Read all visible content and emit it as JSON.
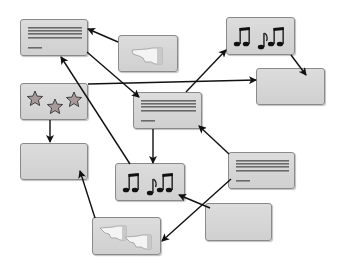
{
  "diagram": {
    "type": "flow-network",
    "colors": {
      "node_fill": "#d4d4d4",
      "node_border": "#8a8a8a",
      "arrow": "#111111",
      "text_lines": "#6a6a6a"
    },
    "nodes": [
      {
        "id": "A",
        "kind": "document",
        "icon": "document-lines-icon",
        "x": 20,
        "y": 19,
        "w": 68,
        "h": 37
      },
      {
        "id": "B",
        "kind": "pointing-hand",
        "icon": "pointing-hand-icon",
        "x": 118,
        "y": 35,
        "w": 60,
        "h": 37
      },
      {
        "id": "C",
        "kind": "music",
        "icon": "music-notes-icon",
        "x": 226,
        "y": 17,
        "w": 69,
        "h": 38
      },
      {
        "id": "D",
        "kind": "empty",
        "icon": "",
        "x": 256,
        "y": 68,
        "w": 69,
        "h": 37
      },
      {
        "id": "E",
        "kind": "stars",
        "icon": "three-stars-icon",
        "x": 20,
        "y": 83,
        "w": 68,
        "h": 37
      },
      {
        "id": "F",
        "kind": "document",
        "icon": "document-lines-icon",
        "x": 133,
        "y": 92,
        "w": 69,
        "h": 37
      },
      {
        "id": "G",
        "kind": "empty",
        "icon": "",
        "x": 20,
        "y": 143,
        "w": 68,
        "h": 37
      },
      {
        "id": "H",
        "kind": "music",
        "icon": "music-notes-icon",
        "x": 115,
        "y": 163,
        "w": 70,
        "h": 38
      },
      {
        "id": "I",
        "kind": "document",
        "icon": "document-lines-icon",
        "x": 228,
        "y": 152,
        "w": 67,
        "h": 37
      },
      {
        "id": "J",
        "kind": "empty",
        "icon": "",
        "x": 205,
        "y": 203,
        "w": 67,
        "h": 38
      },
      {
        "id": "K",
        "kind": "two-pointing-hands",
        "icon": "two-pointing-hands-icon",
        "x": 92,
        "y": 217,
        "w": 69,
        "h": 38
      }
    ],
    "edges": [
      {
        "from": "B",
        "to": "A",
        "x1": 118,
        "y1": 42,
        "x2": 88,
        "y2": 29
      },
      {
        "from": "A",
        "to": "F",
        "x1": 87,
        "y1": 52,
        "x2": 139,
        "y2": 97
      },
      {
        "from": "E",
        "to": "D",
        "x1": 88,
        "y1": 84,
        "x2": 256,
        "y2": 80
      },
      {
        "from": "F",
        "to": "C",
        "x1": 186,
        "y1": 92,
        "x2": 226,
        "y2": 50
      },
      {
        "from": "C",
        "to": "D",
        "x1": 291,
        "y1": 55,
        "x2": 306,
        "y2": 75
      },
      {
        "from": "E",
        "to": "G",
        "x1": 50,
        "y1": 120,
        "x2": 50,
        "y2": 142
      },
      {
        "from": "F",
        "to": "H",
        "x1": 153,
        "y1": 129,
        "x2": 153,
        "y2": 163
      },
      {
        "from": "H",
        "to": "A",
        "x1": 130,
        "y1": 164,
        "x2": 61,
        "y2": 57
      },
      {
        "from": "I",
        "to": "F",
        "x1": 229,
        "y1": 154,
        "x2": 199,
        "y2": 126
      },
      {
        "from": "K",
        "to": "G",
        "x1": 95,
        "y1": 218,
        "x2": 80,
        "y2": 171
      },
      {
        "from": "I",
        "to": "K",
        "x1": 231,
        "y1": 179,
        "x2": 162,
        "y2": 241
      },
      {
        "from": "J",
        "to": "H",
        "x1": 210,
        "y1": 208,
        "x2": 179,
        "y2": 195
      }
    ]
  }
}
